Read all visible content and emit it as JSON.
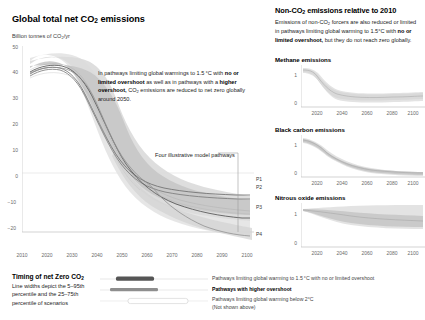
{
  "left": {
    "title_html": "Global total net CO<sub>2</sub> emissions",
    "axis_label_html": "Billion tonnes of CO<sub>2</sub>/yr",
    "annotation_html": "In pathways limiting global warmings to 1.5&#8201;&deg;C with <b>no or limited overshoot</b> as well as in pathways with a <b>higher overshoot,</b> CO<sub>2</sub> emissions are reduced to net zero globally around 2050.",
    "pathways_callout": "Four illustrative model pathways",
    "pathway_labels": [
      "P1",
      "P2",
      "P3",
      "P4"
    ]
  },
  "right": {
    "title_html": "Non-CO<sub>2</sub> emissions relative to 2010",
    "desc_html": "Emissions of non-CO<sub>2</sub> forcers are also reduced or limited in pathways limiting global warming to 1.5&deg;C with <b>no or limited overshoot,</b> but they do not reach zero globally.",
    "panels": [
      {
        "title": "Methane emissions"
      },
      {
        "title": "Black carbon emissions"
      },
      {
        "title": "Nitrous oxide emissions"
      }
    ]
  },
  "legend": {
    "title_html": "Timing of net Zero CO<sub>2</sub>",
    "subtitle": "Line widths depict the 5–95th percentile and the 25–75th percentile of scenarios",
    "rows": [
      {
        "label": "Pathways limiting global warming to 1.5 °C with no or limited overshoot",
        "bold": false
      },
      {
        "label": "Pathways with higher overshoot",
        "bold": true
      },
      {
        "label": "Pathways limiting global warming below 2°C",
        "bold": false
      },
      {
        "label": "(Not shown above)",
        "bold": false
      }
    ]
  },
  "colors": {
    "band_light": "#dcdcdc",
    "band_mid": "#c2c2c2",
    "band_dark": "#9a9a9a",
    "line_dark": "#5a5a5a",
    "axis": "#b8b8b8",
    "text": "#222222"
  },
  "chart_data": {
    "type": "line",
    "title": "Global total net CO2 emissions",
    "xlabel": "",
    "ylabel": "Billion tonnes of CO2/yr",
    "xlim": [
      2010,
      2100
    ],
    "ylim": [
      -22,
      52
    ],
    "xticks": [
      2010,
      2020,
      2030,
      2040,
      2050,
      2060,
      2070,
      2080,
      2090,
      2100
    ],
    "yticks": [
      50,
      40,
      30,
      20,
      10,
      0,
      -10,
      -20
    ],
    "grid": false,
    "legend_position": "bottom",
    "x": [
      2010,
      2020,
      2030,
      2040,
      2050,
      2060,
      2070,
      2080,
      2090,
      2100
    ],
    "series": [
      {
        "name": "P1",
        "values": [
          38,
          40,
          22,
          8,
          0,
          -2,
          -3,
          -3.5,
          -4,
          -4
        ]
      },
      {
        "name": "P2",
        "values": [
          38,
          40,
          24,
          10,
          1,
          -2,
          -4,
          -5,
          -5.5,
          -6
        ]
      },
      {
        "name": "P3",
        "values": [
          38,
          41,
          30,
          18,
          6,
          -1,
          -7,
          -11,
          -13,
          -14
        ]
      },
      {
        "name": "P4",
        "values": [
          38,
          41,
          34,
          26,
          12,
          -13,
          -16,
          -18,
          -20,
          -21
        ]
      },
      {
        "name": "5-95th percentile upper",
        "values": [
          42,
          46,
          38,
          26,
          14,
          6,
          3,
          2,
          2,
          2
        ]
      },
      {
        "name": "5-95th percentile lower",
        "values": [
          35,
          36,
          20,
          6,
          -5,
          -12,
          -17,
          -20,
          -22,
          -23
        ]
      },
      {
        "name": "25-75th percentile upper",
        "values": [
          40,
          43,
          32,
          19,
          8,
          2,
          0,
          -1,
          -1,
          -1
        ]
      },
      {
        "name": "25-75th percentile lower",
        "values": [
          36,
          38,
          24,
          10,
          -1,
          -7,
          -11,
          -14,
          -16,
          -17
        ]
      }
    ],
    "subcharts": [
      {
        "type": "line",
        "title": "Methane emissions",
        "xlim": [
          2010,
          2100
        ],
        "ylim": [
          0,
          1.15
        ],
        "xticks": [
          2020,
          2040,
          2060,
          2080,
          2100
        ],
        "yticks": [
          0,
          1
        ],
        "x": [
          2010,
          2020,
          2030,
          2040,
          2050,
          2060,
          2070,
          2080,
          2090,
          2100
        ],
        "series": [
          {
            "name": "median",
            "values": [
              1.0,
              0.98,
              0.78,
              0.6,
              0.52,
              0.48,
              0.46,
              0.44,
              0.42,
              0.4
            ]
          },
          {
            "name": "upper",
            "values": [
              1.0,
              1.0,
              0.86,
              0.68,
              0.6,
              0.56,
              0.54,
              0.52,
              0.5,
              0.48
            ]
          },
          {
            "name": "lower",
            "values": [
              1.0,
              0.95,
              0.7,
              0.52,
              0.45,
              0.41,
              0.39,
              0.37,
              0.35,
              0.33
            ]
          }
        ]
      },
      {
        "type": "line",
        "title": "Black carbon emissions",
        "xlim": [
          2010,
          2100
        ],
        "ylim": [
          0,
          1.15
        ],
        "xticks": [
          2020,
          2040,
          2060,
          2080,
          2100
        ],
        "yticks": [
          0,
          1
        ],
        "x": [
          2010,
          2020,
          2030,
          2040,
          2050,
          2060,
          2070,
          2080,
          2090,
          2100
        ],
        "series": [
          {
            "name": "median",
            "values": [
              1.0,
              0.88,
              0.66,
              0.47,
              0.36,
              0.3,
              0.27,
              0.25,
              0.23,
              0.22
            ]
          },
          {
            "name": "upper",
            "values": [
              1.0,
              0.94,
              0.76,
              0.57,
              0.45,
              0.38,
              0.34,
              0.31,
              0.29,
              0.28
            ]
          },
          {
            "name": "lower",
            "values": [
              1.0,
              0.82,
              0.56,
              0.38,
              0.28,
              0.23,
              0.2,
              0.18,
              0.17,
              0.16
            ]
          }
        ]
      },
      {
        "type": "line",
        "title": "Nitrous oxide emissions",
        "xlim": [
          2010,
          2100
        ],
        "ylim": [
          0,
          1.3
        ],
        "xticks": [
          2020,
          2040,
          2060,
          2080,
          2100
        ],
        "yticks": [
          0,
          1
        ],
        "x": [
          2010,
          2020,
          2030,
          2040,
          2050,
          2060,
          2070,
          2080,
          2090,
          2100
        ],
        "series": [
          {
            "name": "median",
            "values": [
              1.0,
              0.95,
              0.88,
              0.84,
              0.82,
              0.8,
              0.79,
              0.78,
              0.77,
              0.76
            ]
          },
          {
            "name": "upper",
            "values": [
              1.0,
              1.03,
              1.06,
              1.08,
              1.1,
              1.11,
              1.12,
              1.12,
              1.13,
              1.13
            ]
          },
          {
            "name": "lower",
            "values": [
              1.0,
              0.88,
              0.76,
              0.7,
              0.66,
              0.63,
              0.61,
              0.6,
              0.58,
              0.56
            ]
          }
        ]
      }
    ]
  }
}
